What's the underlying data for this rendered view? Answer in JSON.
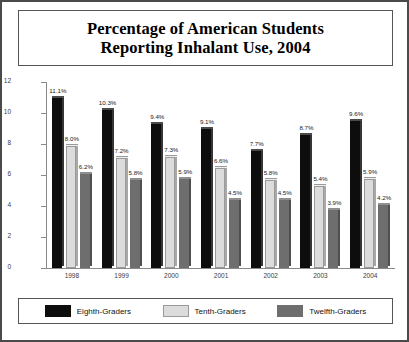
{
  "chart_data": {
    "type": "bar",
    "title": "Percentage of American Students Reporting Inhalant Use, 2004",
    "title_line1": "Percentage of American Students",
    "title_line2": "Reporting Inhalant Use, 2004",
    "xlabel": "",
    "ylabel": "",
    "ylim": [
      0,
      12
    ],
    "yticks": [
      0,
      2,
      4,
      6,
      8,
      10,
      12
    ],
    "ytick_labels": [
      "0",
      "2",
      "4",
      "6",
      "8",
      "10",
      "12"
    ],
    "grid": false,
    "legend_position": "bottom",
    "categories": [
      "1998",
      "1999",
      "2000",
      "2001",
      "2002",
      "2003",
      "2004"
    ],
    "series": [
      {
        "name": "Eighth-Graders",
        "color": "#0d0d0d",
        "values": [
          11.1,
          10.3,
          9.4,
          9.1,
          7.7,
          8.7,
          9.6
        ],
        "labels": [
          "11.1%",
          "10.3%",
          "9.4%",
          "9.1%",
          "7.7%",
          "8.7%",
          "9.6%"
        ]
      },
      {
        "name": "Tenth-Graders",
        "color": "#dcdcdc",
        "values": [
          8.0,
          7.2,
          7.3,
          6.6,
          5.8,
          5.4,
          5.9
        ],
        "labels": [
          "8.0%",
          "7.2%",
          "7.3%",
          "6.6%",
          "5.8%",
          "5.4%",
          "5.9%"
        ]
      },
      {
        "name": "Twelfth-Graders",
        "color": "#6e6e6e",
        "values": [
          6.2,
          5.8,
          5.9,
          4.5,
          4.5,
          3.9,
          4.2
        ],
        "labels": [
          "6.2%",
          "5.8%",
          "5.9%",
          "4.5%",
          "4.5%",
          "3.9%",
          "4.2%"
        ]
      }
    ]
  }
}
